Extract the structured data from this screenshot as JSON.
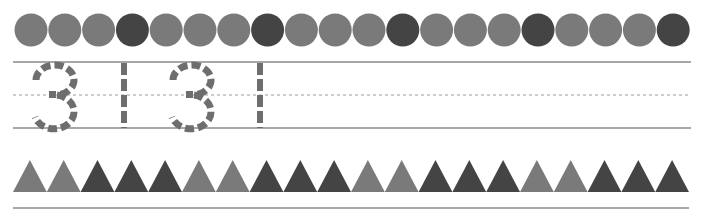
{
  "worksheet": {
    "circle_row": {
      "count": 20,
      "pattern": [
        "light",
        "light",
        "light",
        "dark",
        "light",
        "light",
        "light",
        "dark",
        "light",
        "light",
        "light",
        "dark",
        "light",
        "light",
        "light",
        "dark",
        "light",
        "light",
        "light",
        "dark"
      ]
    },
    "tracing_row": {
      "characters": [
        "3",
        "1",
        "3",
        "1"
      ],
      "style": "dashed-outline"
    },
    "triangle_row": {
      "count": 20,
      "pattern": [
        "light",
        "light",
        "dark",
        "dark",
        "dark",
        "light",
        "light",
        "dark",
        "dark",
        "dark",
        "light",
        "light",
        "dark",
        "dark",
        "dark",
        "light",
        "light",
        "dark",
        "dark",
        "dark"
      ]
    },
    "colors": {
      "light": "#7a7a7a",
      "dark": "#444444",
      "line": "#8a8a8a",
      "trace": "#6e6e6e"
    }
  }
}
